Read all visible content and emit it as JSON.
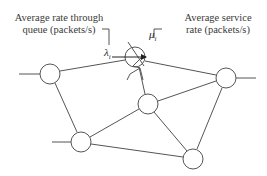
{
  "diagram": {
    "labels": {
      "arrival_line1": "Average rate through",
      "arrival_line2": "queue (packets/s)",
      "service_line1": "Average service",
      "service_line2": "rate (packets/s)"
    },
    "symbols": {
      "lambda": "λ",
      "lambda_sub": "i",
      "mu": "μ",
      "mu_sub": "i"
    },
    "colors": {
      "stroke": "#555555",
      "text": "#3a3a3a",
      "background": "#ffffff"
    },
    "nodes": [
      {
        "id": "left",
        "cx": 50,
        "cy": 74,
        "r": 10
      },
      {
        "id": "top-center-queue",
        "cx": 135,
        "cy": 57,
        "r": 10
      },
      {
        "id": "right",
        "cx": 226,
        "cy": 78,
        "r": 10
      },
      {
        "id": "middle",
        "cx": 148,
        "cy": 104,
        "r": 10
      },
      {
        "id": "bottom-left",
        "cx": 81,
        "cy": 142,
        "r": 10
      },
      {
        "id": "bottom-right",
        "cx": 193,
        "cy": 159,
        "r": 10
      }
    ]
  }
}
